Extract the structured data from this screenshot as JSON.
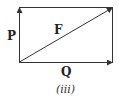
{
  "diagram": {
    "type": "vector-parallelogram",
    "vectors": [
      {
        "name": "P",
        "direction": "up",
        "side": "left"
      },
      {
        "name": "Q",
        "direction": "right",
        "side": "bottom"
      },
      {
        "name": "F",
        "direction": "diagonal-resultant"
      }
    ],
    "labels": {
      "p": "P",
      "q": "Q",
      "f": "F"
    },
    "caption": "(iii)",
    "colors": {
      "stroke": "#333333",
      "background": "#ffffff"
    }
  }
}
